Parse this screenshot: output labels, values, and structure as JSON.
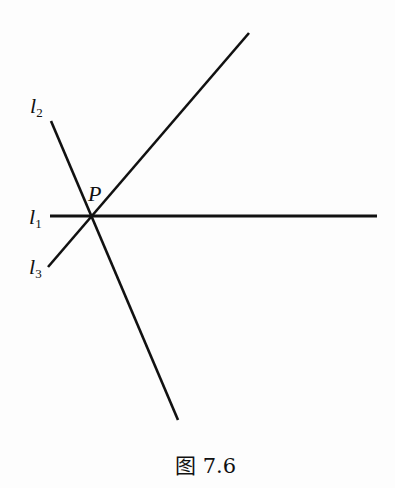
{
  "figure": {
    "caption": "图 7.6",
    "point": {
      "name": "P",
      "x": 90,
      "y": 216
    },
    "lines": [
      {
        "id": "l1",
        "name": "l",
        "subscript": "1",
        "x1": 50,
        "y1": 216,
        "x2": 377,
        "y2": 216
      },
      {
        "id": "l2",
        "name": "l",
        "subscript": "2",
        "x1": 51,
        "y1": 121,
        "x2": 178,
        "y2": 420
      },
      {
        "id": "l3",
        "name": "l",
        "subscript": "3",
        "x1": 48,
        "y1": 267,
        "x2": 249,
        "y2": 33
      }
    ],
    "colors": {
      "stroke": "#111111",
      "background": "#fdfdfd"
    }
  }
}
